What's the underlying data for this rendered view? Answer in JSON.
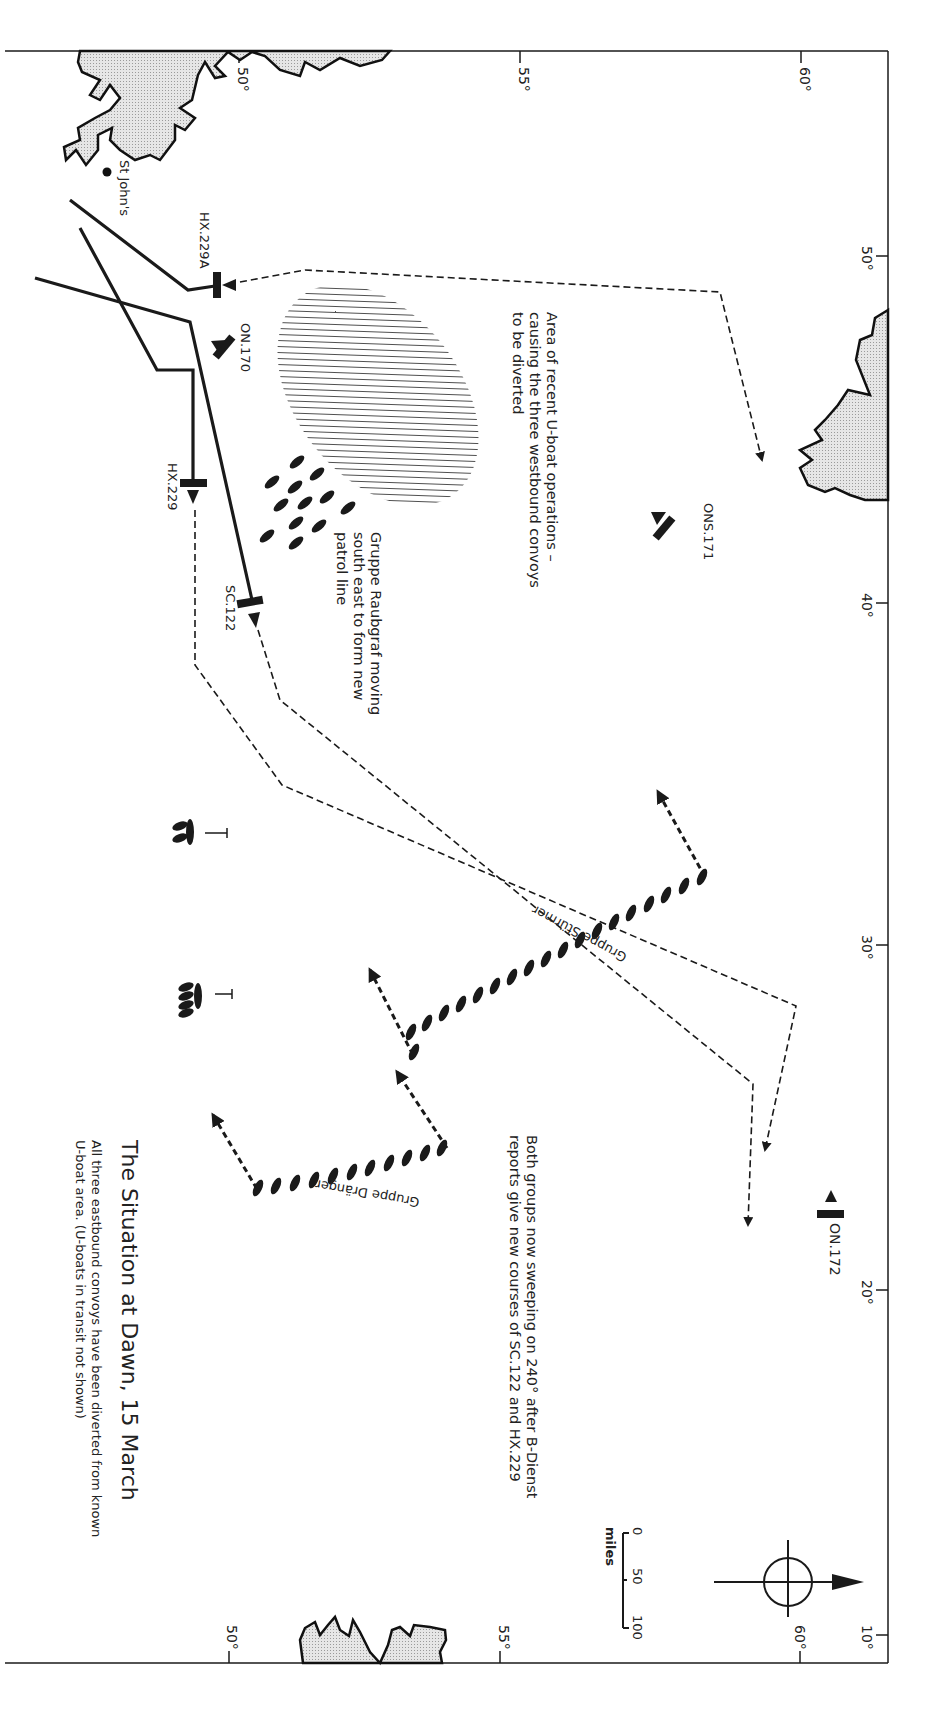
{
  "map": {
    "title": "The Situation at Dawn, 15 March",
    "subtitle": "All three eastbound convoys have been diverted from known\nU-boat area. (U-boats in transit not shown)",
    "orientation": "rotated 90° clockwise (north points right)",
    "latitude_ticks_top": [
      "50°",
      "55°",
      "60°"
    ],
    "latitude_ticks_bottom": [
      "50°",
      "55°",
      "60°"
    ],
    "longitude_ticks": [
      "50°",
      "40°",
      "30°",
      "20°",
      "10°"
    ],
    "places": [
      {
        "name": "St John's"
      }
    ],
    "convoys": [
      {
        "id": "HX.229A",
        "direction": "eastbound"
      },
      {
        "id": "ON.170",
        "direction": "westbound"
      },
      {
        "id": "HX.229",
        "direction": "eastbound"
      },
      {
        "id": "SC.122",
        "direction": "eastbound"
      },
      {
        "id": "ONS.171",
        "direction": "westbound"
      },
      {
        "id": "ON.172",
        "direction": "westbound"
      }
    ],
    "uboat_groups": [
      {
        "name": "Gruppe Raubgraf",
        "count": 12
      },
      {
        "name": "Gruppe Stürmer",
        "count": 19
      },
      {
        "name": "Gruppe Dränger",
        "count": 11
      }
    ],
    "tankers": [
      {
        "label": "T"
      },
      {
        "label": "T"
      }
    ],
    "notes": {
      "area": "Area of recent U-boat operations –\ncausing the three westbound convoys\nto be diverted",
      "raubgraf": "Gruppe Raubgraf moving\nsouth east to form new\npatrol line",
      "sweep": "Both groups now sweeping on 240° after B-Dienst\nreports give new courses of SC.122 and HX.229"
    },
    "scale": {
      "unit": "miles",
      "ticks": [
        "0",
        "50",
        "100"
      ]
    },
    "colors": {
      "ink": "#1a1a1a",
      "land": "#d8d8d8",
      "paper": "#ffffff"
    }
  }
}
